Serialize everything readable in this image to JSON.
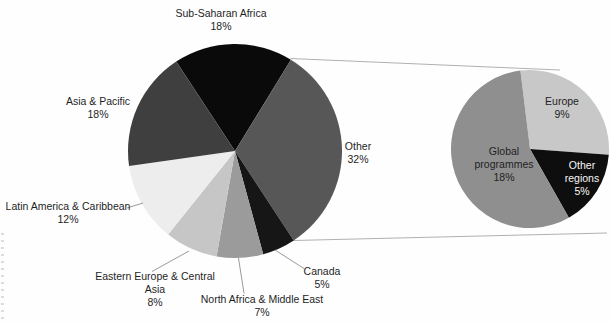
{
  "chart_data": {
    "type": "pie",
    "variant": "pie-of-pie",
    "title": "",
    "unit": "%",
    "legend": "none",
    "main_pie": {
      "start_angle_deg": -33.3,
      "slices": [
        {
          "label": "Sub-Saharan Africa",
          "value": 18,
          "color": "#0a0a0a"
        },
        {
          "label": "Other",
          "value": 32,
          "color": "#575757"
        },
        {
          "label": "Canada",
          "value": 5,
          "color": "#161616"
        },
        {
          "label": "North Africa & Middle East",
          "value": 7,
          "color": "#9b9b9b"
        },
        {
          "label": "Eastern Europe & Central Asia",
          "value": 8,
          "color": "#c6c6c6"
        },
        {
          "label": "Latin America & Caribbean",
          "value": 12,
          "color": "#ededed"
        },
        {
          "label": "Asia & Pacific",
          "value": 18,
          "color": "#3f3f3f"
        }
      ]
    },
    "secondary_pie": {
      "source_slice": "Other",
      "start_angle_deg": -7,
      "slices": [
        {
          "label": "Europe",
          "value": 9,
          "color": "#c8c8c8"
        },
        {
          "label": "Other regions",
          "value": 5,
          "color": "#0e0e0e"
        },
        {
          "label": "Global programmes",
          "value": 18,
          "color": "#8f8f8f"
        }
      ]
    }
  },
  "labels": {
    "sub_saharan": [
      "Sub-Saharan Africa",
      "18%"
    ],
    "asia_pacific": [
      "Asia & Pacific",
      "18%"
    ],
    "latin_america": [
      "Latin America & Caribbean",
      "12%"
    ],
    "eastern_europe": [
      "Eastern Europe & Central",
      "Asia",
      "8%"
    ],
    "north_africa": [
      "North Africa & Middle East",
      "7%"
    ],
    "canada": [
      "Canada",
      "5%"
    ],
    "other": [
      "Other",
      "32%"
    ],
    "europe": [
      "Europe",
      "9%"
    ],
    "global_programmes": [
      "Global",
      "programmes",
      "18%"
    ],
    "other_regions": [
      "Other",
      "regions",
      "5%"
    ]
  }
}
